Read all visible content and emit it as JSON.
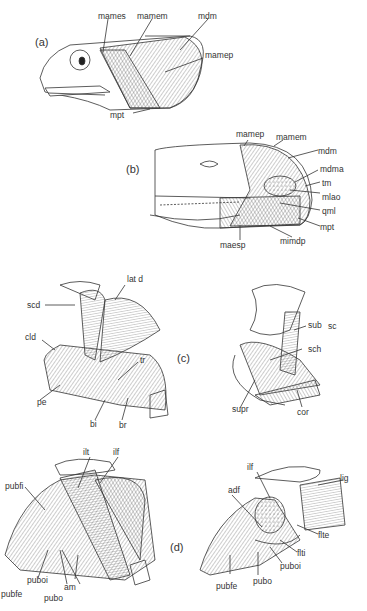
{
  "figure": {
    "panels": [
      {
        "id": "a",
        "label": "(a)",
        "subject": "lizard head, jaw musculature lateral view",
        "labels": [
          "mames",
          "mamem",
          "mdm",
          "mamep",
          "mpt"
        ]
      },
      {
        "id": "b",
        "label": "(b)",
        "subject": "lizard head, deeper jaw musculature",
        "labels": [
          "mamep",
          "mamem",
          "mdm",
          "mdma",
          "tm",
          "mlao",
          "qml",
          "mpt",
          "mimdp",
          "maesp"
        ]
      },
      {
        "id": "c",
        "label": "(c)",
        "subject": "shoulder and forelimb musculature",
        "labels_left": [
          "lat d",
          "scd",
          "cld",
          "tr",
          "pe",
          "bi",
          "br"
        ],
        "labels_right": [
          "sub",
          "sc",
          "sch",
          "supr",
          "cor"
        ]
      },
      {
        "id": "d",
        "label": "(d)",
        "subject": "pelvic and hindlimb musculature",
        "labels_left": [
          "ilt",
          "ilf",
          "pubfi",
          "puboi",
          "am",
          "pubfe",
          "pubo"
        ],
        "labels_right": [
          "ilf",
          "lig",
          "adf",
          "flte",
          "flti",
          "puboi",
          "pubfe",
          "pubo"
        ]
      }
    ]
  },
  "text": {
    "a_label": "(a)",
    "a_mames": "mames",
    "a_mamem": "mamem",
    "a_mdm": "mdm",
    "a_mamep": "mamep",
    "a_mpt": "mpt",
    "b_label": "(b)",
    "b_mamep": "mamep",
    "b_mamem": "mamem",
    "b_mdm": "mdm",
    "b_mdma": "mdma",
    "b_tm": "tm",
    "b_mlao": "mlao",
    "b_qml": "qml",
    "b_mpt": "mpt",
    "b_mimdp": "mimdp",
    "b_maesp": "maesp",
    "c_label": "(c)",
    "c_latd": "lat  d",
    "c_scd": "scd",
    "c_cld": "cld",
    "c_tr": "tr",
    "c_pe": "pe",
    "c_bi": "bi",
    "c_br": "br",
    "c_sub": "sub",
    "c_sc": "sc",
    "c_sch": "sch",
    "c_supr": "supr",
    "c_cor": "cor",
    "d_label": "(d)",
    "d_ilt": "ilt",
    "d_ilf": "ilf",
    "d_pubfi": "pubfi",
    "d_puboi": "puboi",
    "d_am": "am",
    "d_pubfe": "pubfe",
    "d_pubo": "pubo",
    "d2_ilf": "ilf",
    "d2_lig": "lig",
    "d2_adf": "adf",
    "d2_flte": "flte",
    "d2_flti": "flti",
    "d2_puboi": "puboi",
    "d2_pubfe": "pubfe",
    "d2_pubo": "pubo"
  }
}
